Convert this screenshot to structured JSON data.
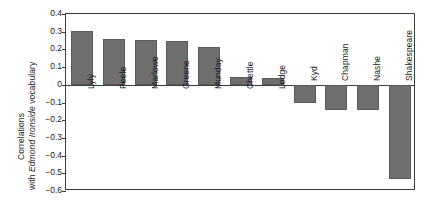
{
  "chart_data": {
    "type": "bar",
    "title": "",
    "subtitle": "",
    "xlabel": "",
    "ylabel": "Correlations with Edmond Ironside vocabulary",
    "ylabel_lines": [
      {
        "text": "Correlations",
        "italic_part": ""
      },
      {
        "text": "with Edmond Ironside vocabulary",
        "plain_prefix": "with ",
        "italic": "Edmond Ironside",
        "plain_suffix": " vocabulary"
      }
    ],
    "categories": [
      "Lyly",
      "Peele",
      "Marlowe",
      "Greene",
      "Munday",
      "Chettle",
      "Lodge",
      "Kyd",
      "Chapman",
      "Nashe",
      "Shakespeare"
    ],
    "values": [
      0.305,
      0.26,
      0.255,
      0.25,
      0.215,
      0.045,
      0.04,
      -0.105,
      -0.145,
      -0.145,
      -0.535
    ],
    "ylim": [
      -0.6,
      0.4
    ],
    "yticks": [
      0.4,
      0.3,
      0.2,
      0.1,
      0,
      -0.1,
      -0.2,
      -0.3,
      -0.4,
      -0.5,
      -0.6
    ],
    "ytick_labels": [
      "0.4",
      "0.3",
      "0.2",
      "0.1",
      "0",
      "−0.1",
      "−0.2",
      "−0.3",
      "−0.4",
      "−0.5",
      "−0.6"
    ],
    "grid": false,
    "legend": null,
    "bar_color": "#6e6e6e",
    "axis_color": "#3c3c3c",
    "text_color": "#1a1a1a"
  }
}
